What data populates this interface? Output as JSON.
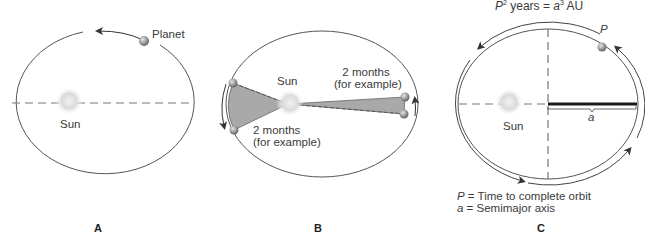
{
  "panels": [
    {
      "id": "A",
      "letter": "A",
      "labels": {
        "planet": "Planet",
        "sun": "Sun"
      }
    },
    {
      "id": "B",
      "letter": "B",
      "labels": {
        "sun": "Sun",
        "right_sector_line1": "2 months",
        "right_sector_line2": "(for example)",
        "left_sector_line1": "2 months",
        "left_sector_line2": "(for example)"
      }
    },
    {
      "id": "C",
      "letter": "C",
      "labels": {
        "formula_P": "P",
        "formula_exp_P": "2",
        "formula_mid": " years = ",
        "formula_a": "a",
        "formula_exp_a": "3",
        "formula_unit": " AU",
        "planet_P": "P",
        "semimajor_a": "a",
        "sun": "Sun",
        "legend_P_symbol": "P",
        "legend_P_text": " = Time to complete orbit",
        "legend_a_symbol": "a",
        "legend_a_text": " = Semimajor axis"
      }
    }
  ],
  "colors": {
    "orbit_line": "#555555",
    "dashed_axis": "#666666",
    "sector_fill": "#a9a9a9",
    "sun_glow": "#d9d9d9",
    "planet": "#8c8c8c",
    "semimajor_bar": "#1a1a1a"
  }
}
